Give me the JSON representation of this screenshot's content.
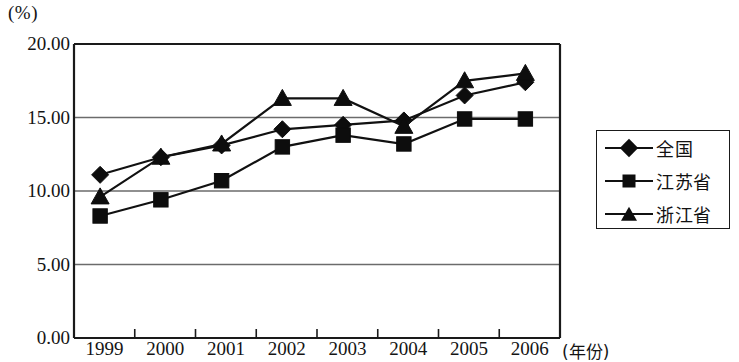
{
  "chart_data": {
    "type": "line",
    "title": "",
    "subtitle": "",
    "xlabel": "(年份)",
    "ylabel": "(%)",
    "categories": [
      "1999",
      "2000",
      "2001",
      "2002",
      "2003",
      "2004",
      "2005",
      "2006"
    ],
    "yticks": [
      "0.00",
      "5.00",
      "10.00",
      "15.00",
      "20.00"
    ],
    "ylim": [
      0,
      20
    ],
    "grid": true,
    "legend_position": "right",
    "series": [
      {
        "name": "全国",
        "marker": "diamond",
        "values": [
          11.1,
          12.3,
          13.1,
          14.2,
          14.5,
          14.8,
          16.5,
          17.4
        ]
      },
      {
        "name": "江苏省",
        "marker": "square",
        "values": [
          8.3,
          9.4,
          10.7,
          13.0,
          13.8,
          13.2,
          14.9,
          14.9
        ]
      },
      {
        "name": "浙江省",
        "marker": "triangle",
        "values": [
          9.6,
          12.3,
          13.2,
          16.3,
          16.3,
          14.4,
          17.5,
          18.0
        ]
      }
    ],
    "colors": {
      "line": "#111111",
      "marker": "#0d0d0d",
      "grid": "#6b6b6b",
      "axis": "#1a1a1a",
      "background": "#ffffff"
    }
  }
}
